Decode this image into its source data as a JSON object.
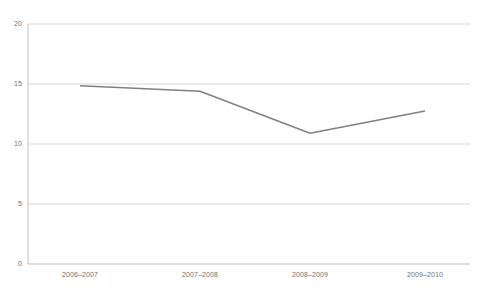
{
  "chart_data": {
    "type": "line",
    "title": "",
    "subtitle": "",
    "xlabel": "",
    "ylabel": "",
    "categories": [
      "2006–2007",
      "2007–2008",
      "2008–2009",
      "2009–2010"
    ],
    "series": [
      {
        "name": "",
        "values": [
          14.85,
          14.4,
          10.9,
          12.75
        ]
      }
    ],
    "ylim": [
      0,
      20
    ],
    "yticks": [
      0,
      5,
      10,
      15,
      20
    ],
    "ytick_labels": [
      "0",
      "5",
      "10",
      "15",
      "20"
    ],
    "grid": "horizontal",
    "legend": "none",
    "markers": false,
    "colors": {
      "line": "#808080",
      "grid": "#d9d9d9",
      "axis": "#bfbfbf",
      "tick_text": "#6f6f6f",
      "background": "#ffffff"
    }
  }
}
